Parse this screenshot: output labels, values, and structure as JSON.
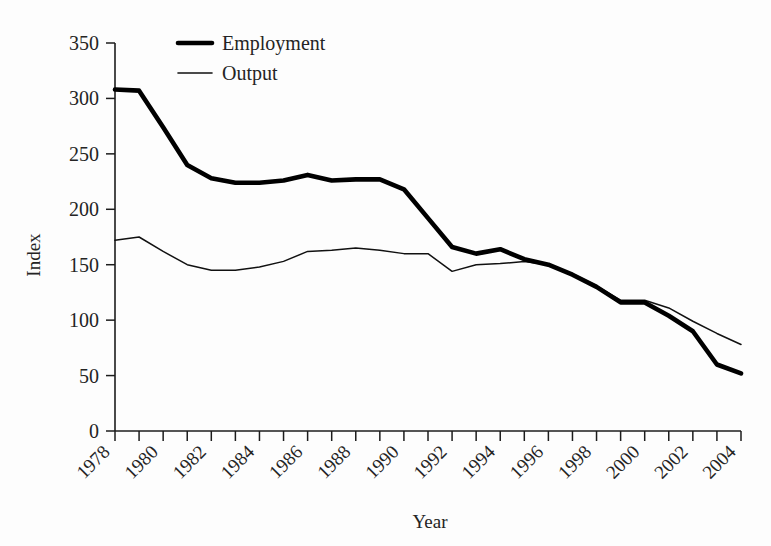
{
  "chart_data": {
    "type": "line",
    "title": "",
    "xlabel": "Year",
    "ylabel": "Index",
    "xlim": [
      1978,
      2004
    ],
    "ylim": [
      0,
      350
    ],
    "yticks": [
      0,
      50,
      100,
      150,
      200,
      250,
      300,
      350
    ],
    "xticks_all": [
      1978,
      1979,
      1980,
      1981,
      1982,
      1983,
      1984,
      1985,
      1986,
      1987,
      1988,
      1989,
      1990,
      1991,
      1992,
      1993,
      1994,
      1995,
      1996,
      1997,
      1998,
      1999,
      2000,
      2001,
      2002,
      2003,
      2004
    ],
    "xtick_labels": [
      "1978",
      "1980",
      "1982",
      "1984",
      "1986",
      "1988",
      "1990",
      "1992",
      "1994",
      "1996",
      "1998",
      "2000",
      "2002",
      "2004"
    ],
    "grid": false,
    "legend_position": "top-left-inside",
    "x": [
      1978,
      1979,
      1980,
      1981,
      1982,
      1983,
      1984,
      1985,
      1986,
      1987,
      1988,
      1989,
      1990,
      1991,
      1992,
      1993,
      1994,
      1995,
      1996,
      1997,
      1998,
      1999,
      2000,
      2001,
      2002,
      2003,
      2004
    ],
    "series": [
      {
        "name": "Employment",
        "color": "#000000",
        "line_width": "thick",
        "values": [
          308,
          307,
          274,
          240,
          228,
          224,
          224,
          226,
          231,
          226,
          227,
          227,
          218,
          192,
          166,
          160,
          164,
          155,
          150,
          141,
          130,
          116,
          116,
          104,
          90,
          60,
          52
        ]
      },
      {
        "name": "Output",
        "color": "#111111",
        "line_width": "thin",
        "values": [
          172,
          175,
          162,
          150,
          145,
          145,
          148,
          153,
          162,
          163,
          165,
          163,
          160,
          160,
          144,
          150,
          151,
          153,
          150,
          142,
          131,
          118,
          118,
          111,
          99,
          88,
          78
        ]
      }
    ]
  },
  "axis": {
    "y_title": "Index",
    "x_title": "Year",
    "y_tick_labels": [
      "0",
      "50",
      "100",
      "150",
      "200",
      "250",
      "300",
      "350"
    ]
  },
  "legend": {
    "items": [
      {
        "label": "Employment",
        "swatch": "thick-line-swatch"
      },
      {
        "label": "Output",
        "swatch": "thin-line-swatch"
      }
    ]
  }
}
